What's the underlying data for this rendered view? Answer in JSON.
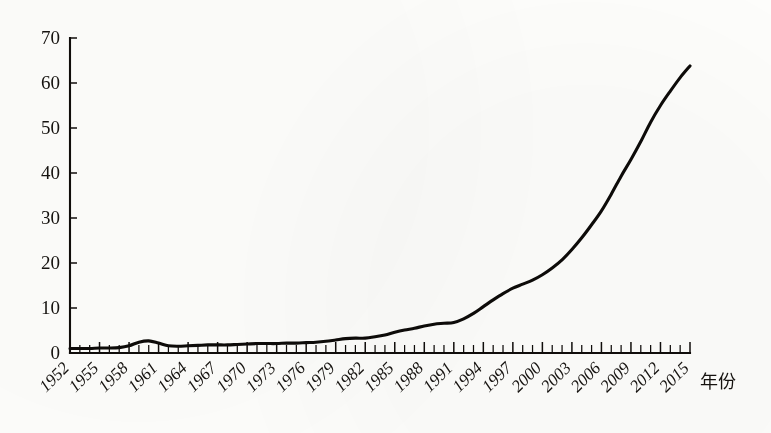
{
  "chart_data": {
    "type": "line",
    "title": "",
    "subtitle": "",
    "xlabel": "年份",
    "ylabel": "",
    "legend": [],
    "legend_position": "none",
    "grid": false,
    "xlim": [
      1952,
      2015
    ],
    "ylim": [
      0,
      70
    ],
    "y_ticks": [
      0,
      10,
      20,
      30,
      40,
      50,
      60,
      70
    ],
    "y_tick_labels": [
      "0",
      "10",
      "20",
      "30",
      "40",
      "50",
      "60",
      "70"
    ],
    "x_tick_labels": [
      "1952",
      "1955",
      "1958",
      "1961",
      "1964",
      "1967",
      "1970",
      "1973",
      "1976",
      "1979",
      "1982",
      "1985",
      "1988",
      "1991",
      "1994",
      "1997",
      "2000",
      "2003",
      "2006",
      "2009",
      "2012",
      "2015"
    ],
    "x_tick_step": 3,
    "x_minor_tick_step": 1,
    "x_tick_label_rotation": 45,
    "series": [
      {
        "name": "",
        "x": [
          1952,
          1953,
          1954,
          1955,
          1956,
          1957,
          1958,
          1959,
          1960,
          1961,
          1962,
          1963,
          1964,
          1965,
          1966,
          1967,
          1968,
          1969,
          1970,
          1971,
          1972,
          1973,
          1974,
          1975,
          1976,
          1977,
          1978,
          1979,
          1980,
          1981,
          1982,
          1983,
          1984,
          1985,
          1986,
          1987,
          1988,
          1989,
          1990,
          1991,
          1992,
          1993,
          1994,
          1995,
          1996,
          1997,
          1998,
          1999,
          2000,
          2001,
          2002,
          2003,
          2004,
          2005,
          2006,
          2007,
          2008,
          2009,
          2010,
          2011,
          2012,
          2013,
          2014,
          2015
        ],
        "values": [
          1.0,
          1.0,
          1.0,
          1.1,
          1.1,
          1.2,
          1.6,
          2.4,
          2.7,
          2.2,
          1.6,
          1.5,
          1.6,
          1.7,
          1.8,
          1.8,
          1.8,
          1.9,
          2.0,
          2.1,
          2.1,
          2.1,
          2.2,
          2.2,
          2.3,
          2.4,
          2.6,
          2.9,
          3.2,
          3.3,
          3.3,
          3.6,
          4.0,
          4.6,
          5.1,
          5.5,
          6.0,
          6.4,
          6.6,
          6.8,
          7.6,
          8.8,
          10.3,
          11.8,
          13.2,
          14.4,
          15.3,
          16.2,
          17.4,
          18.9,
          20.7,
          23.0,
          25.6,
          28.5,
          31.6,
          35.3,
          39.3,
          43.0,
          47.0,
          51.3,
          55.0,
          58.2,
          61.2,
          63.8
        ]
      }
    ],
    "annotations": []
  },
  "axis": {
    "x_title": "年份"
  }
}
